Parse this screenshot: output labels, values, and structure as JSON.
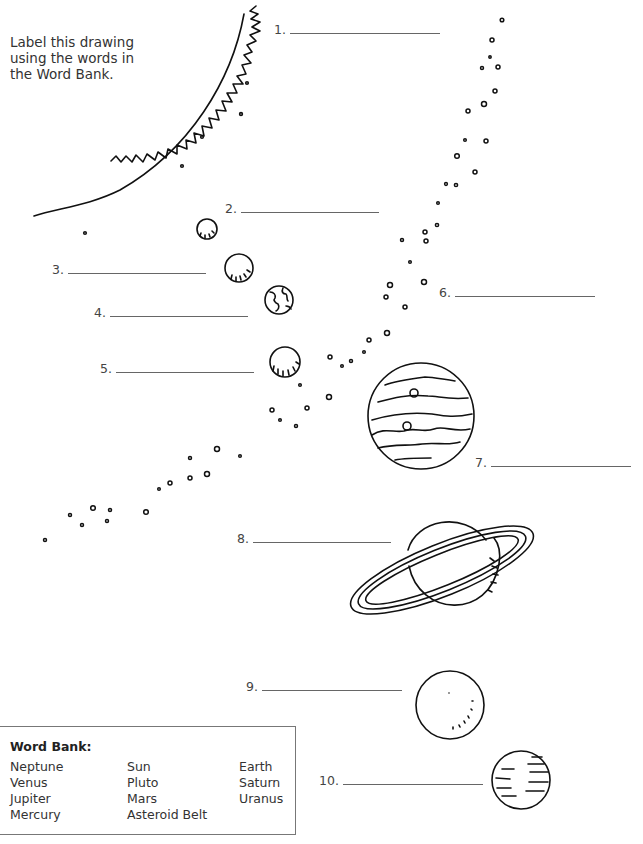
{
  "instructions": "Label this drawing using the words in the Word Bank.",
  "labels": [
    {
      "number": "1.",
      "answer": "",
      "x": 274,
      "y": 24,
      "line_width": 150
    },
    {
      "number": "2.",
      "answer": "",
      "x": 225,
      "y": 203,
      "line_width": 138
    },
    {
      "number": "3.",
      "answer": "",
      "x": 52,
      "y": 264,
      "line_width": 138
    },
    {
      "number": "4.",
      "answer": "",
      "x": 94,
      "y": 307,
      "line_width": 138
    },
    {
      "number": "5.",
      "answer": "",
      "x": 100,
      "y": 363,
      "line_width": 138
    },
    {
      "number": "6.",
      "answer": "",
      "x": 439,
      "y": 287,
      "line_width": 140
    },
    {
      "number": "7.",
      "answer": "",
      "x": 475,
      "y": 457,
      "line_width": 140
    },
    {
      "number": "8.",
      "answer": "",
      "x": 237,
      "y": 533,
      "line_width": 138
    },
    {
      "number": "9.",
      "answer": "",
      "x": 246,
      "y": 681,
      "line_width": 140
    },
    {
      "number": "10.",
      "answer": "",
      "x": 319,
      "y": 775,
      "line_width": 140
    }
  ],
  "word_bank": {
    "title": "Word Bank:",
    "columns": [
      [
        "Neptune",
        "Venus",
        "Jupiter",
        "Mercury"
      ],
      [
        "Sun",
        "Pluto",
        "Mars",
        "Asteroid Belt"
      ],
      [
        "Earth",
        "Saturn",
        "Uranus"
      ]
    ]
  },
  "drawing": {
    "bodies": [
      {
        "name": "sun",
        "label_number": "1."
      },
      {
        "name": "mercury",
        "label_number": "2."
      },
      {
        "name": "venus",
        "label_number": "3."
      },
      {
        "name": "earth",
        "label_number": "4."
      },
      {
        "name": "mars",
        "label_number": "5."
      },
      {
        "name": "asteroid-belt",
        "label_number": "6."
      },
      {
        "name": "jupiter",
        "label_number": "7."
      },
      {
        "name": "saturn",
        "label_number": "8."
      },
      {
        "name": "uranus",
        "label_number": "9."
      },
      {
        "name": "neptune",
        "label_number": "10."
      }
    ]
  }
}
